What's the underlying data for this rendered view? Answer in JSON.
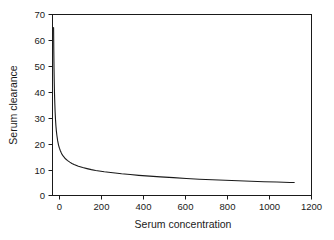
{
  "chart_data": {
    "type": "line",
    "title": "",
    "xlabel": "Serum concentration",
    "ylabel": "Serum clearance",
    "xlim": [
      0,
      1200
    ],
    "ylim": [
      0,
      70
    ],
    "xticks": [
      0,
      200,
      400,
      600,
      800,
      1000,
      1200
    ],
    "yticks": [
      0,
      10,
      20,
      30,
      40,
      50,
      60,
      70
    ],
    "xtick_labels": [
      "0",
      "200",
      "400",
      "600",
      "800",
      "1000",
      "1200"
    ],
    "ytick_labels": [
      "0",
      "10",
      "20",
      "30",
      "40",
      "50",
      "60",
      "70"
    ],
    "grid": false,
    "legend": false,
    "line_color": "#1a1a1a",
    "markers": "none",
    "series": [
      {
        "name": "Serum clearance",
        "x": [
          5,
          6,
          7,
          8,
          9,
          10,
          12,
          14,
          16,
          18,
          20,
          24,
          28,
          32,
          36,
          40,
          45,
          50,
          60,
          70,
          80,
          90,
          100,
          120,
          140,
          160,
          180,
          200,
          240,
          280,
          320,
          360,
          400,
          450,
          500,
          560,
          620,
          680,
          740,
          800,
          860,
          920,
          980,
          1040,
          1100,
          1120
        ],
        "y": [
          65.0,
          56.0,
          49.3,
          44.3,
          40.4,
          37.3,
          32.6,
          29.3,
          26.8,
          24.9,
          23.4,
          21.1,
          19.5,
          18.3,
          17.4,
          16.6,
          15.8,
          15.2,
          14.2,
          13.5,
          12.9,
          12.4,
          12.0,
          11.3,
          10.8,
          10.4,
          10.0,
          9.7,
          9.2,
          8.8,
          8.4,
          8.1,
          7.8,
          7.5,
          7.2,
          6.9,
          6.6,
          6.3,
          6.1,
          5.9,
          5.7,
          5.5,
          5.3,
          5.2,
          5.0,
          5.0
        ]
      }
    ],
    "description_note": "Monotonic hyperbolic decay: clearance falls steeply from about 65 near zero concentration and flattens to an asymptote of roughly 2 at high concentration."
  },
  "axes": {
    "x_title": "Serum concentration",
    "y_title": "Serum clearance"
  }
}
